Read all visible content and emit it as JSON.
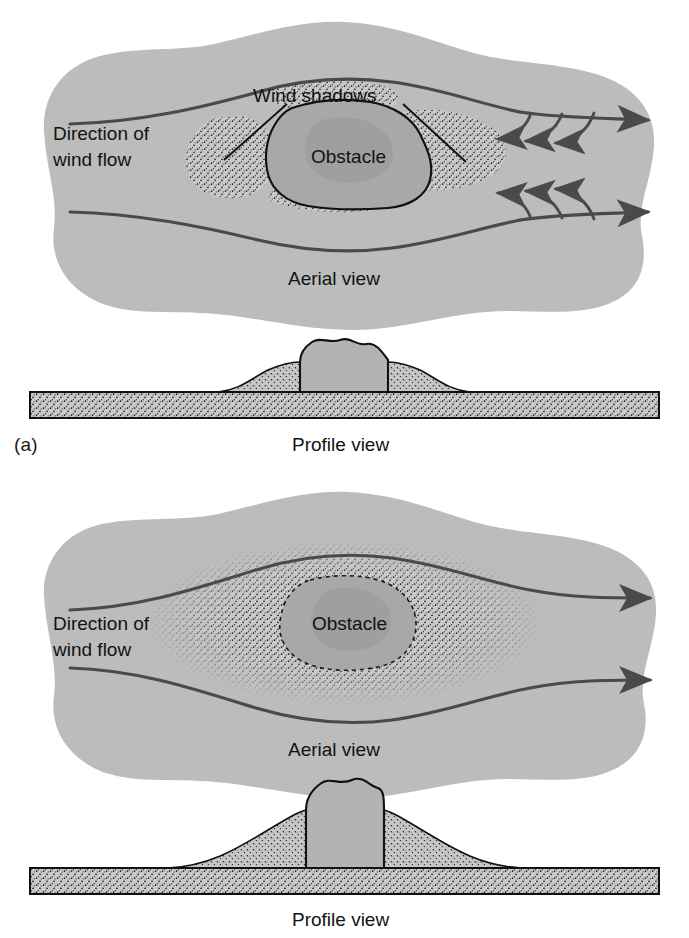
{
  "figure": {
    "panels": [
      {
        "key": "a",
        "label": "(a)",
        "aerial": {
          "view_label": "Aerial view",
          "direction_label_line1": "Direction of",
          "direction_label_line2": "wind flow",
          "obstacle_label": "Obstacle",
          "shadow_label": "Wind shadows",
          "streamlines": 2,
          "eddy_arrows_per_side": 3,
          "leader_lines": 2,
          "sand_distribution": "lateral and lee sides only"
        },
        "profile": {
          "view_label": "Profile view",
          "drift_size": "small"
        }
      },
      {
        "key": "b",
        "label": "(b)",
        "aerial": {
          "view_label": "Aerial view",
          "direction_label_line1": "Direction of",
          "direction_label_line2": "wind flow",
          "obstacle_label": "Obstacle",
          "streamlines": 2,
          "eddy_arrows_per_side": 0,
          "leader_lines": 0,
          "sand_distribution": "encircling the obstacle"
        },
        "profile": {
          "view_label": "Profile view",
          "drift_size": "large"
        }
      }
    ],
    "colors": {
      "page_background": "#ffffff",
      "air_mass": "#bcbcbc",
      "obstacle_fill": "#a8a8a8",
      "obstacle_shade": "#9c9c9c",
      "ground_fill": "#c9c9c9",
      "drift_fill": "#c4c4c4",
      "stipple": "#1c1c1c",
      "streamline": "#4a4a4a",
      "outline": "#101010",
      "text": "#121212"
    }
  }
}
